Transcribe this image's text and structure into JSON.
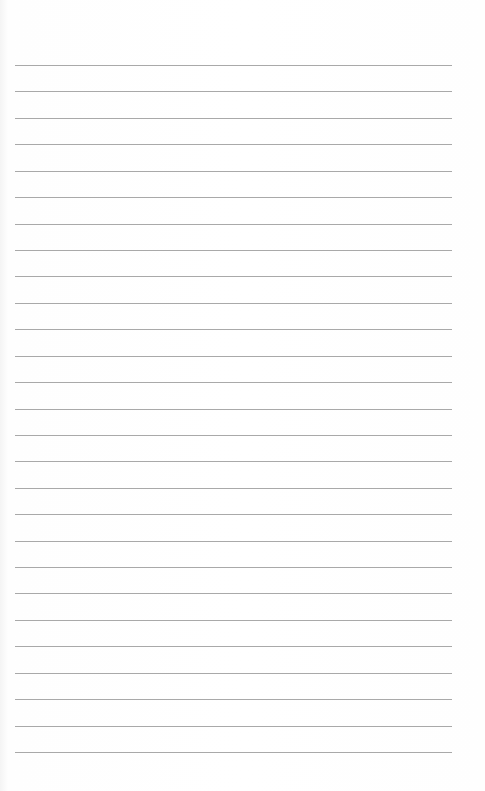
{
  "document": {
    "type": "lined-paper",
    "line_count": 27,
    "line_color": "#a9a9a9",
    "paper_color": "#ffffff",
    "lines": []
  }
}
